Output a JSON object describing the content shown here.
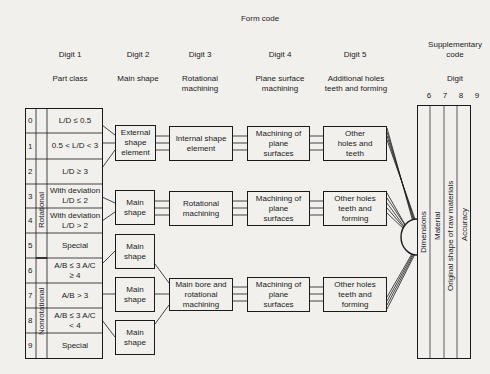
{
  "title": "Form code",
  "columns": [
    {
      "digit": "Digit 1",
      "label": "Part class"
    },
    {
      "digit": "Digit 2",
      "label": "Main shape"
    },
    {
      "digit": "Digit 3",
      "label": "Rotational machining"
    },
    {
      "digit": "Digit 4",
      "label": "Plane surface machining"
    },
    {
      "digit": "Digit 5",
      "label": "Additional holes teeth and forming"
    }
  ],
  "supplementary": {
    "title": "Supplementary code",
    "digit_label": "Digit",
    "digits": [
      "6",
      "7",
      "8",
      "9"
    ],
    "items": [
      "Dimensions",
      "Material",
      "Original shape of raw materials",
      "Accuracy"
    ]
  },
  "part_class": {
    "group_rotational": "Rotational",
    "group_nonrotational": "Nonrotational",
    "rows": [
      {
        "num": "0",
        "text": "L/D ≤ 0.5"
      },
      {
        "num": "1",
        "text": "0.5 < L/D < 3"
      },
      {
        "num": "2",
        "text": "L/D ≥ 3"
      },
      {
        "num": "3",
        "text": "With deviation L/D ≤ 2"
      },
      {
        "num": "4",
        "text": "With deviation L/D > 2"
      },
      {
        "num": "5",
        "text": "Special"
      },
      {
        "num": "6",
        "text": "A/B ≤ 3 A/C ≥ 4"
      },
      {
        "num": "7",
        "text": "A/B > 3"
      },
      {
        "num": "8",
        "text": "A/B ≤ 3 A/C < 4"
      },
      {
        "num": "9",
        "text": "Special"
      }
    ]
  },
  "boxes": {
    "d2_ext": "External shape element",
    "d2_main1": "Main shape",
    "d2_main2": "Main shape",
    "d2_main3": "Main shape",
    "d2_main4": "Main shape",
    "d3_internal": "Internal shape element",
    "d3_rotational": "Rotational machining",
    "d3_mainbore": "Main bore and rotational machining",
    "d4_r1": "Machining of plane surfaces",
    "d4_r2": "Machining of plane surfaces",
    "d4_r3": "Machining of plane surfaces",
    "d5_r1": "Other holes and teeth",
    "d5_r2": "Other holes teeth and forming",
    "d5_r3": "Other holes teeth and forming"
  }
}
